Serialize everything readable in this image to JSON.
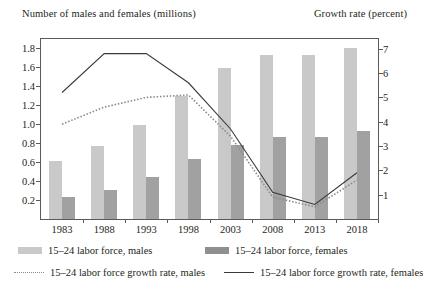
{
  "chart_data": {
    "type": "bar",
    "title": "",
    "ylabel": "Number of males and females (millions)",
    "ylabel_secondary": "Growth rate (percent)",
    "xlabel": "",
    "categories": [
      "1983",
      "1988",
      "1993",
      "1998",
      "2003",
      "2008",
      "2013",
      "2018"
    ],
    "ylim": [
      0,
      1.9
    ],
    "yticks": [
      "0.2",
      "0.4",
      "0.6",
      "0.8",
      "1.0",
      "1.2",
      "1.4",
      "1.6",
      "1.8"
    ],
    "ylim_secondary": [
      0,
      7.4
    ],
    "yticks_secondary": [
      "1",
      "2",
      "3",
      "4",
      "5",
      "6",
      "7"
    ],
    "grid": false,
    "legend_position": "bottom",
    "series": [
      {
        "name": "15–24 labor force, males",
        "type": "bar",
        "axis": "left",
        "color": "#c9c9c9",
        "values": [
          0.61,
          0.77,
          0.99,
          1.3,
          1.59,
          1.73,
          1.73,
          1.81
        ]
      },
      {
        "name": "15–24 labor force, females",
        "type": "bar",
        "axis": "left",
        "color": "#a1a1a1",
        "values": [
          0.23,
          0.31,
          0.44,
          0.63,
          0.78,
          0.87,
          0.87,
          0.93
        ]
      },
      {
        "name": "15–24 labor force growth rate, males",
        "type": "line",
        "style": "dotted",
        "axis": "right",
        "color": "#8a8a8a",
        "values": [
          3.9,
          4.6,
          5.0,
          5.1,
          3.4,
          0.9,
          0.5,
          1.6
        ]
      },
      {
        "name": "15–24 labor force growth rate, females",
        "type": "line",
        "style": "solid",
        "axis": "right",
        "color": "#3a3a3a",
        "values": [
          5.2,
          6.8,
          6.8,
          5.6,
          3.7,
          1.1,
          0.6,
          1.9
        ]
      }
    ]
  },
  "legend": {
    "items": [
      {
        "label": "15–24 labor force, males",
        "marker": "bar-light"
      },
      {
        "label": "15–24 labor force, females",
        "marker": "bar-dark"
      },
      {
        "label": "15–24 labor force growth rate, males",
        "marker": "line-dotted"
      },
      {
        "label": "15–24 labor force growth rate, females",
        "marker": "line-solid"
      }
    ]
  }
}
